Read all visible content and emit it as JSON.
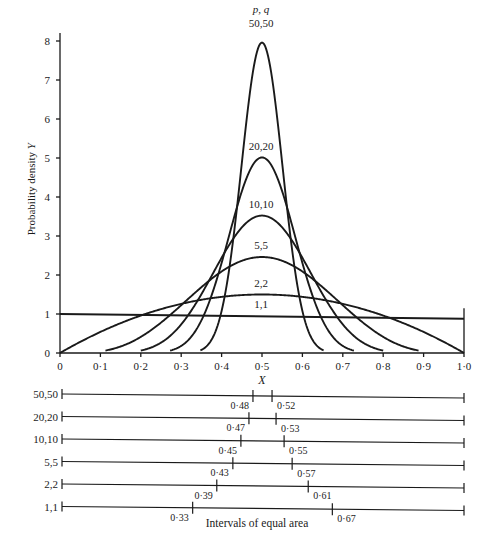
{
  "chart_data": {
    "type": "line",
    "title": "",
    "xlabel": "X",
    "ylabel": "Probability density Y",
    "legend_header": "p, q",
    "xlim": [
      0,
      1.0
    ],
    "ylim": [
      0,
      8
    ],
    "grid": false,
    "x_ticks": [
      "0",
      "0·1",
      "0·2",
      "0·3",
      "0·4",
      "0·5",
      "0·6",
      "0·7",
      "0·8",
      "0·9",
      "1·0"
    ],
    "y_ticks": [
      "0",
      "1",
      "2",
      "3",
      "4",
      "5",
      "6",
      "7",
      "8"
    ],
    "series": [
      {
        "name": "1,1",
        "p": 1,
        "q": 1,
        "peak": 1.0
      },
      {
        "name": "2,2",
        "p": 2,
        "q": 2,
        "peak": 1.5
      },
      {
        "name": "5,5",
        "p": 5,
        "q": 5,
        "peak": 2.46
      },
      {
        "name": "10,10",
        "p": 10,
        "q": 10,
        "peak": 3.52
      },
      {
        "name": "20,20",
        "p": 20,
        "q": 20,
        "peak": 5.0
      },
      {
        "name": "50,50",
        "p": 50,
        "q": 50,
        "peak": 7.96
      }
    ],
    "equal_area_intervals": {
      "caption": "Intervals of equal area",
      "rows": [
        {
          "label": "50,50",
          "lower": "0·48",
          "upper": "0·52",
          "lo": 0.48,
          "hi": 0.52
        },
        {
          "label": "20,20",
          "lower": "0·47",
          "upper": "0·53",
          "lo": 0.47,
          "hi": 0.53
        },
        {
          "label": "10,10",
          "lower": "0·45",
          "upper": "0·55",
          "lo": 0.45,
          "hi": 0.55
        },
        {
          "label": "5,5",
          "lower": "0·43",
          "upper": "0·57",
          "lo": 0.43,
          "hi": 0.57
        },
        {
          "label": "2,2",
          "lower": "0·39",
          "upper": "0·61",
          "lo": 0.39,
          "hi": 0.61
        },
        {
          "label": "1,1",
          "lower": "0·33",
          "upper": "0·67",
          "lo": 0.33,
          "hi": 0.67
        }
      ]
    }
  }
}
